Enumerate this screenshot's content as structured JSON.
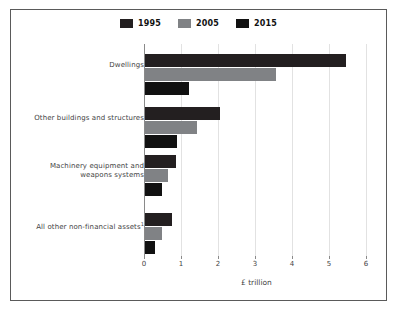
{
  "chart_data": {
    "type": "bar",
    "orientation": "horizontal",
    "title": "",
    "xlabel": "£ trillion",
    "ylabel": "",
    "xlim": [
      0,
      6
    ],
    "xticks": [
      "0",
      "1",
      "2",
      "3",
      "4",
      "5",
      "6"
    ],
    "grid": true,
    "legend_position": "top-center",
    "categories": [
      "Dwellings",
      "Other buildings and structures",
      "Machinery equipment and weapons systems",
      "All other non-financial assets"
    ],
    "category_footnote_markers": [
      "",
      "",
      "",
      "1"
    ],
    "series": [
      {
        "name": "1995",
        "color": "#231f20",
        "values": [
          5.43,
          2.02,
          0.83,
          0.72
        ]
      },
      {
        "name": "2005",
        "color": "#808285",
        "values": [
          3.53,
          1.4,
          0.63,
          0.46
        ]
      },
      {
        "name": "2015",
        "color": "#111111",
        "values": [
          1.18,
          0.86,
          0.45,
          0.28
        ]
      }
    ]
  },
  "legend": {
    "items": [
      {
        "label": "1995",
        "color": "#231f20"
      },
      {
        "label": "2005",
        "color": "#808285"
      },
      {
        "label": "2015",
        "color": "#111111"
      }
    ]
  },
  "axis": {
    "x_title": "£ trillion",
    "ticks": [
      "0",
      "1",
      "2",
      "3",
      "4",
      "5",
      "6"
    ]
  },
  "categories": [
    {
      "line1": "Dwellings",
      "line2": "",
      "footnote": ""
    },
    {
      "line1": "Other buildings and structures",
      "line2": "",
      "footnote": ""
    },
    {
      "line1": "Machinery equipment and",
      "line2": "weapons systems",
      "footnote": ""
    },
    {
      "line1": "All other non-financial assets",
      "line2": "",
      "footnote": "1"
    }
  ]
}
